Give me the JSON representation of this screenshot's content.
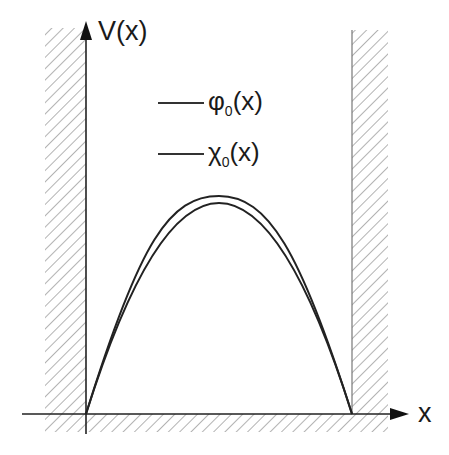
{
  "diagram": {
    "type": "infinite square well with trial wavefunction",
    "axes": {
      "y_label": "V(x)",
      "x_label": "x"
    },
    "legend": [
      {
        "symbol": "φ",
        "subscript": "0",
        "arg": "(x)",
        "label": "φ0(x)"
      },
      {
        "symbol": "χ",
        "subscript": "0",
        "arg": "(x)",
        "label": "χ0(x)"
      }
    ],
    "curves": [
      {
        "name": "φ0(x)",
        "shape": "sine half-period",
        "peak": "higher"
      },
      {
        "name": "χ0(x)",
        "shape": "parabola",
        "peak": "lower"
      }
    ],
    "walls": [
      "left infinite wall (hatched)",
      "right infinite wall (hatched)",
      "floor (hatched)"
    ],
    "colors": {
      "line": "#222222",
      "hatch": "#888888",
      "background": "#ffffff"
    }
  }
}
